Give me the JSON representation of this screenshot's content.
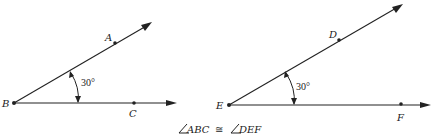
{
  "figures": [
    {
      "vertex": "B",
      "point_on_upper_ray": "A",
      "point_on_lower_ray": "C",
      "angle_label": "30°"
    },
    {
      "vertex": "E",
      "point_on_upper_ray": "D",
      "point_on_lower_ray": "F",
      "angle_label": "30°"
    }
  ],
  "caption": {
    "left_angle": "ABC",
    "relation": "≅",
    "right_angle": "DEF"
  },
  "colors": {
    "ink": "#222222",
    "background": "#ffffff"
  }
}
